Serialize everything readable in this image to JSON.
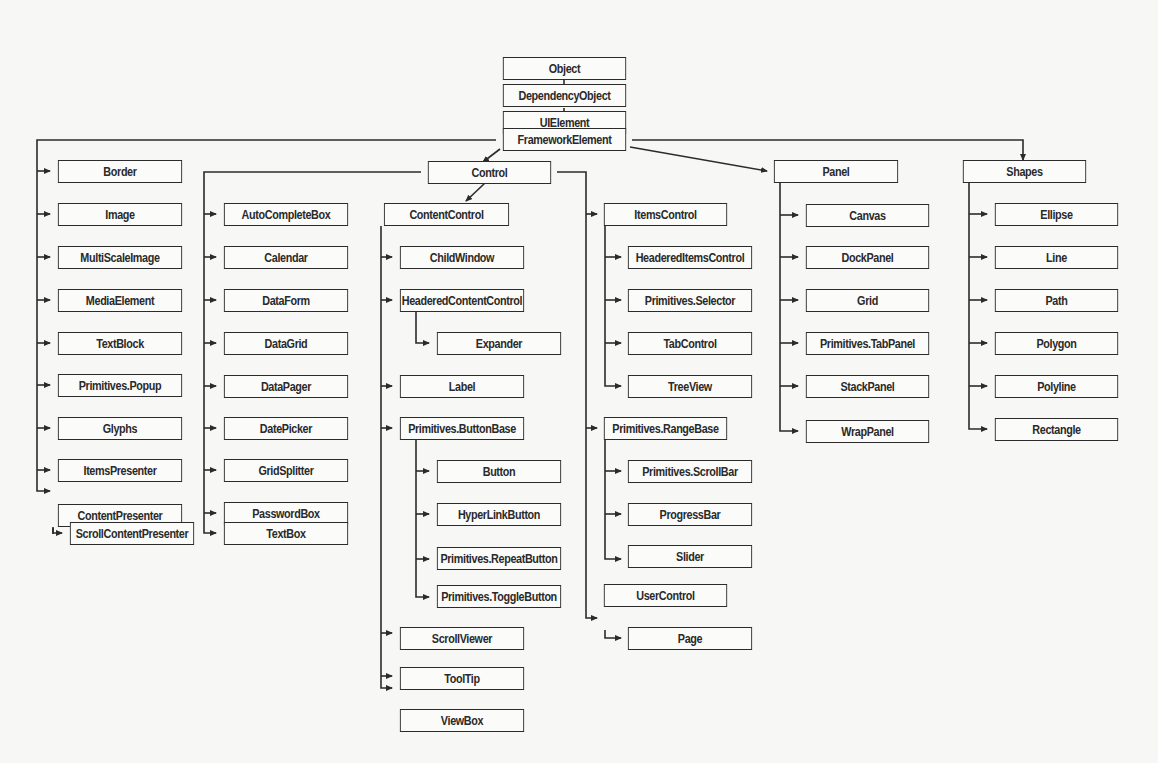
{
  "diagram": {
    "type": "class-hierarchy",
    "line_color": "#2b2b2b",
    "box_fill": "#fbfbfa",
    "background": "#f7f7f5",
    "nodes": {
      "object": "Object",
      "dependency_object": "DependencyObject",
      "ui_element": "UIElement",
      "framework_element": "FrameworkElement",
      "border": "Border",
      "image": "Image",
      "multi_scale_image": "MultiScaleImage",
      "media_element": "MediaElement",
      "text_block": "TextBlock",
      "primitives_popup": "Primitives.Popup",
      "glyphs": "Glyphs",
      "items_presenter": "ItemsPresenter",
      "content_presenter": "ContentPresenter",
      "scroll_content_presenter": "ScrollContentPresenter",
      "control": "Control",
      "auto_complete_box": "AutoCompleteBox",
      "calendar": "Calendar",
      "data_form": "DataForm",
      "data_grid": "DataGrid",
      "data_pager": "DataPager",
      "date_picker": "DatePicker",
      "grid_splitter": "GridSplitter",
      "password_box": "PasswordBox",
      "text_box": "TextBox",
      "content_control": "ContentControl",
      "child_window": "ChildWindow",
      "headered_content_control": "HeaderedContentControl",
      "expander": "Expander",
      "label": "Label",
      "primitives_button_base": "Primitives.ButtonBase",
      "button": "Button",
      "hyperlink_button": "HyperLinkButton",
      "primitives_repeat_button": "Primitives.RepeatButton",
      "primitives_toggle_button": "Primitives.ToggleButton",
      "scroll_viewer": "ScrollViewer",
      "tool_tip": "ToolTip",
      "view_box": "ViewBox",
      "items_control": "ItemsControl",
      "headered_items_control": "HeaderedItemsControl",
      "primitives_selector": "Primitives.Selector",
      "tab_control": "TabControl",
      "tree_view": "TreeView",
      "primitives_range_base": "Primitives.RangeBase",
      "primitives_scroll_bar": "Primitives.ScrollBar",
      "progress_bar": "ProgressBar",
      "slider": "Slider",
      "user_control": "UserControl",
      "page": "Page",
      "panel": "Panel",
      "canvas": "Canvas",
      "dock_panel": "DockPanel",
      "grid": "Grid",
      "primitives_tab_panel": "Primitives.TabPanel",
      "stack_panel": "StackPanel",
      "wrap_panel": "WrapPanel",
      "shapes": "Shapes",
      "ellipse": "Ellipse",
      "line": "Line",
      "path": "Path",
      "polygon": "Polygon",
      "polyline": "Polyline",
      "rectangle": "Rectangle"
    }
  }
}
